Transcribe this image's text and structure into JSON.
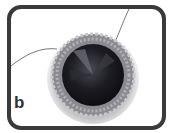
{
  "figure": {
    "label": "b",
    "colors": {
      "frame": "#3a3a3a",
      "background": "#ffffff",
      "crystal": "#1a1a1e",
      "beads": "#9a9aa0"
    }
  }
}
